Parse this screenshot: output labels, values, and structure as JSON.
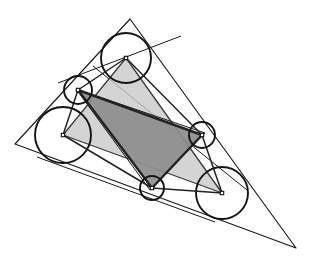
{
  "figure": {
    "width": 312,
    "height": 262,
    "background_color": "#ffffff"
  },
  "colors": {
    "stroke": "#1a1a1a",
    "circle_stroke": "#141414",
    "light_triangle_fill": "#c8c8c8",
    "dark_triangle_fill": "#8d8d8d",
    "light_triangle_stroke": "#3a3a3a",
    "dark_triangle_stroke": "#232323",
    "center_dot_fill": "#ffffff"
  },
  "chart_data": {
    "type": "scatter",
    "xlabel": "",
    "ylabel": "",
    "xlim": [
      0,
      312
    ],
    "ylim": [
      0,
      262
    ],
    "grid": false,
    "legend": "none",
    "outer_triangle": {
      "name": "outer-triangle",
      "vertices": [
        [
          130,
          19
        ],
        [
          296,
          248
        ],
        [
          15,
          144
        ]
      ]
    },
    "medial_triangle": {
      "name": "medial-triangle",
      "vertices": [
        [
          205,
          133
        ],
        [
          150,
          190
        ],
        [
          76,
          89
        ]
      ]
    },
    "big_circles": [
      {
        "name": "top-circle",
        "cx": 126,
        "cy": 58,
        "r": 25
      },
      {
        "name": "left-circle",
        "cx": 63,
        "cy": 135,
        "r": 28
      },
      {
        "name": "lower-right-circle",
        "cx": 222,
        "cy": 193,
        "r": 26
      }
    ],
    "small_circles": [
      {
        "name": "upper-left-small-circle",
        "cx": 78,
        "cy": 90,
        "r": 14
      },
      {
        "name": "right-small-circle",
        "cx": 202,
        "cy": 135,
        "r": 13
      },
      {
        "name": "bottom-small-circle",
        "cx": 152,
        "cy": 188,
        "r": 12
      }
    ],
    "light_triangle": {
      "name": "big-circle-center-triangle",
      "vertices": [
        [
          126,
          58
        ],
        [
          63,
          135
        ],
        [
          222,
          193
        ]
      ]
    },
    "dark_triangle": {
      "name": "small-circle-center-triangle",
      "vertices": [
        [
          78,
          90
        ],
        [
          202,
          135
        ],
        [
          152,
          188
        ]
      ]
    },
    "chords": [
      {
        "name": "chord-top-left",
        "x1": 58,
        "y1": 83,
        "x2": 181,
        "y2": 36
      },
      {
        "name": "chord-left-bottom",
        "x1": 37,
        "y1": 157,
        "x2": 215,
        "y2": 222
      },
      {
        "name": "chord-right",
        "x1": 247,
        "y1": 190,
        "x2": 93,
        "y2": 66
      }
    ],
    "spokes": [
      {
        "name": "spoke-top-to-upper-left",
        "x1": 126,
        "y1": 58,
        "x2": 78,
        "y2": 90
      },
      {
        "name": "spoke-top-to-right",
        "x1": 126,
        "y1": 58,
        "x2": 202,
        "y2": 135
      },
      {
        "name": "spoke-left-to-upper-left",
        "x1": 63,
        "y1": 135,
        "x2": 78,
        "y2": 90
      },
      {
        "name": "spoke-left-to-bottom",
        "x1": 63,
        "y1": 135,
        "x2": 152,
        "y2": 188
      },
      {
        "name": "spoke-lower-right-to-right",
        "x1": 222,
        "y1": 193,
        "x2": 202,
        "y2": 135
      },
      {
        "name": "spoke-lower-right-to-bottom",
        "x1": 222,
        "y1": 193,
        "x2": 152,
        "y2": 188
      }
    ],
    "center_markers": [
      {
        "name": "center-top",
        "cx": 126,
        "cy": 58
      },
      {
        "name": "center-left",
        "cx": 63,
        "cy": 135
      },
      {
        "name": "center-lower-right",
        "cx": 222,
        "cy": 193
      },
      {
        "name": "center-upper-left-small",
        "cx": 78,
        "cy": 90
      },
      {
        "name": "center-right-small",
        "cx": 202,
        "cy": 135
      },
      {
        "name": "center-bottom-small",
        "cx": 152,
        "cy": 188
      }
    ]
  }
}
